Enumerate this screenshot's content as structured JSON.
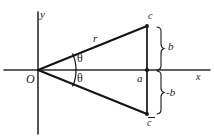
{
  "figure": {
    "background_color": "#ffffff",
    "ink_color": "#1a1a1a",
    "axes": {
      "x_label": "x",
      "y_label": "y",
      "origin_label": "O",
      "x_axis": {
        "x1": 4,
        "y1": 70,
        "x2": 210,
        "y2": 70
      },
      "y_axis": {
        "x1": 38,
        "y1": 12,
        "x2": 38,
        "y2": 134
      }
    },
    "points": [
      {
        "name": "origin",
        "label": "O",
        "x": 38,
        "y": 70
      },
      {
        "name": "foot",
        "label": "a",
        "x": 147,
        "y": 70
      },
      {
        "name": "upper-vertex",
        "label": "c",
        "x": 147,
        "y": 26
      },
      {
        "name": "lower-vertex",
        "label": "c",
        "overbar": true,
        "x": 147,
        "y": 114
      }
    ],
    "rays": [
      {
        "name": "ray-to-c",
        "from": "origin",
        "to": "upper-vertex",
        "label": "r"
      },
      {
        "name": "ray-to-c-conj",
        "from": "origin",
        "to": "lower-vertex",
        "label": ""
      }
    ],
    "segments": [
      {
        "name": "vertical-chord",
        "x": 147,
        "y1": 26,
        "y2": 114
      }
    ],
    "angles": [
      {
        "name": "theta-upper",
        "label": "θ",
        "between": "x-axis and ray-to-c"
      },
      {
        "name": "theta-lower",
        "label": "θ",
        "between": "x-axis and ray-to-c-conj"
      }
    ],
    "braces": [
      {
        "name": "brace-b",
        "label": "b",
        "y_top": 26,
        "y_bottom": 70,
        "x": 160
      },
      {
        "name": "brace-minus-b",
        "label": "-b",
        "y_top": 70,
        "y_bottom": 114,
        "x": 160
      }
    ]
  }
}
